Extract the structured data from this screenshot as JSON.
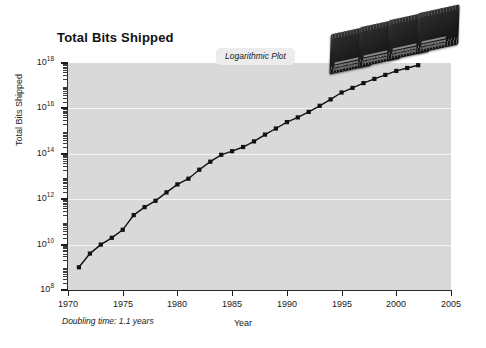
{
  "figure": {
    "width": 486,
    "height": 348,
    "background_color": "#ffffff",
    "plot_background_color": "#d9d9d9",
    "gridline_color": "#f3f3f3",
    "series_color": "#111111"
  },
  "title": "Total Bits Shipped",
  "badge": {
    "label": "Logarithmic Plot"
  },
  "annotations": {
    "doubling_time": "Doubling time: 1.1 years"
  },
  "axes": {
    "x_title": "Year",
    "y_title": "Total Bits Shipped",
    "x_ticks": [
      1970,
      1975,
      1980,
      1985,
      1990,
      1995,
      2000,
      2005
    ],
    "x_tick_labels": [
      "1970",
      "1975",
      "1980",
      "1985",
      "1990",
      "1995",
      "2000",
      "2005"
    ],
    "y_tick_exponents": [
      8,
      10,
      12,
      14,
      16,
      18
    ],
    "y_tick_labels": [
      "10",
      "10",
      "10",
      "10",
      "10",
      "10"
    ],
    "y_tick_superscripts": [
      "8",
      "10",
      "12",
      "14",
      "16",
      "18"
    ]
  },
  "decorations": {
    "chips_count": 4,
    "chips_name": "dram-memory-chips"
  },
  "chart_data": {
    "type": "line",
    "title": "Total Bits Shipped",
    "xlabel": "Year",
    "ylabel": "Total Bits Shipped",
    "yscale": "log",
    "xlim": [
      1970,
      2005
    ],
    "ylim": [
      100000000.0,
      1e+18
    ],
    "grid": true,
    "legend": false,
    "marker": "square",
    "annotations": [
      "Logarithmic Plot",
      "Doubling time: 1.1 years"
    ],
    "x": [
      1971,
      1972,
      1973,
      1974,
      1975,
      1976,
      1977,
      1978,
      1979,
      1980,
      1981,
      1982,
      1983,
      1984,
      1985,
      1986,
      1987,
      1988,
      1989,
      1990,
      1991,
      1992,
      1993,
      1994,
      1995,
      1996,
      1997,
      1998,
      1999,
      2000,
      2001,
      2002
    ],
    "y": [
      1000000000.0,
      4000000000.0,
      10000000000.0,
      20000000000.0,
      45000000000.0,
      200000000000.0,
      450000000000.0,
      850000000000.0,
      2000000000000.0,
      4500000000000.0,
      8000000000000.0,
      20000000000000.0,
      45000000000000.0,
      90000000000000.0,
      130000000000000.0,
      200000000000000.0,
      350000000000000.0,
      700000000000000.0,
      1300000000000000.0,
      2500000000000000.0,
      4000000000000000.0,
      7000000000000000.0,
      1.3e+16,
      2.5e+16,
      5e+16,
      8e+16,
      1.3e+17,
      2e+17,
      3e+17,
      4.5e+17,
      6e+17,
      8e+17
    ],
    "y_labels": [
      "1e9",
      "4e9",
      "1e10",
      "2e10",
      "4.5e10",
      "2e11",
      "4.5e11",
      "8.5e11",
      "2e12",
      "4.5e12",
      "8e12",
      "2e13",
      "4.5e13",
      "9e13",
      "1.3e14",
      "2e14",
      "3.5e14",
      "7e14",
      "1.3e15",
      "2.5e15",
      "4e15",
      "7e15",
      "1.3e16",
      "2.5e16",
      "5e16",
      "8e16",
      "1.3e17",
      "2e17",
      "3e17",
      "4.5e17",
      "6e17",
      "8e17"
    ]
  }
}
